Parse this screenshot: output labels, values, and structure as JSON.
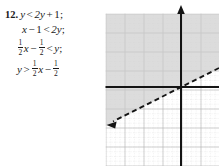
{
  "exercise": {
    "number": "12.",
    "steps": [
      {
        "id": "step-1",
        "plain": "y < 2y + 1;",
        "lhs": "y",
        "relation": "<",
        "rhs_term1": "2y",
        "rhs_op": "+",
        "rhs_term2": "1",
        "terminator": ";"
      },
      {
        "id": "step-2",
        "plain": "x - 1 < 2y;",
        "lhs_term1": "x",
        "lhs_op": "−",
        "lhs_term2": "1",
        "relation": "<",
        "rhs": "2y",
        "terminator": ";"
      },
      {
        "id": "step-3",
        "plain": "1/2 x - 1/2 < y;",
        "frac1_num": "1",
        "frac1_den": "2",
        "var1": "x",
        "op": "−",
        "frac2_num": "1",
        "frac2_den": "2",
        "relation": "<",
        "rhs": "y",
        "terminator": ";"
      },
      {
        "id": "step-4",
        "plain": "y > 1/2 x - 1/2",
        "lhs": "y",
        "relation": ">",
        "frac1_num": "1",
        "frac1_den": "2",
        "var1": "x",
        "op": "−",
        "frac2_num": "1",
        "frac2_den": "2",
        "terminator": ""
      }
    ]
  },
  "graph": {
    "description": "Coordinate plane graph of the inequality y > 1/2 x - 1/2",
    "boundary_line": {
      "style": "dashed",
      "slope": 0.5,
      "y_intercept": -0.5,
      "x_intercept": 1,
      "equation": "y = 1/2 x - 1/2",
      "arrow_end": "lower-left"
    },
    "shaded_region": {
      "side": "above",
      "inequality": "y > 1/2 x - 1/2",
      "fill_color": "#d2d2d2"
    },
    "axes": {
      "x_axis_color": "#1a1a1a",
      "y_axis_color": "#1a1a1a",
      "y_axis_arrow": "up",
      "origin_x": 78,
      "origin_y": 87
    },
    "grid": {
      "major_color": "#a8a8a8",
      "minor_color": "#cfcfcf",
      "major_spacing": 19,
      "minor_divisions": 4,
      "visible": true
    }
  }
}
